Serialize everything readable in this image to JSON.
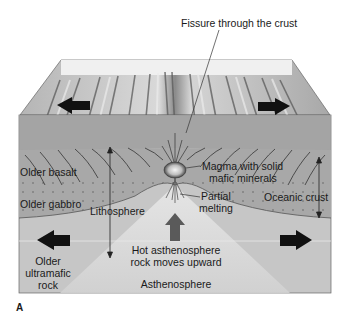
{
  "figure": {
    "panel_letter": "A"
  },
  "labels": {
    "fissure": "Fissure through the crust",
    "older_basalt": "Older basalt",
    "older_gabbro": "Older gabbro",
    "lithosphere": "Lithosphere",
    "magma_line1": "Magma with solid",
    "magma_line2": "mafic minerals",
    "partial_line1": "Partial",
    "partial_line2": "melting",
    "oceanic_crust": "Oceanic crust",
    "hot_line1": "Hot asthenosphere",
    "hot_line2": "rock moves upward",
    "older_line1": "Older",
    "older_line2": "ultramafic",
    "older_line3": "rock",
    "asthenosphere": "Asthenosphere"
  },
  "arrows": {
    "surface_left": "spreading-left",
    "surface_right": "spreading-right",
    "mantle_left": "spreading-left",
    "mantle_right": "spreading-right",
    "center": "upwelling"
  },
  "colors": {
    "background": "#ffffff",
    "sky_strip": "#f2f2f2",
    "surface_light": "#cfcfcf",
    "surface_dark": "#6e6e6e",
    "crust": "#a9a9a9",
    "mantle": "#c8c8c8",
    "asthenosphere_cone": "#dadada",
    "upwelling_arrow": "#5a5a5a",
    "arrow": "#111111",
    "outline": "#555555"
  }
}
